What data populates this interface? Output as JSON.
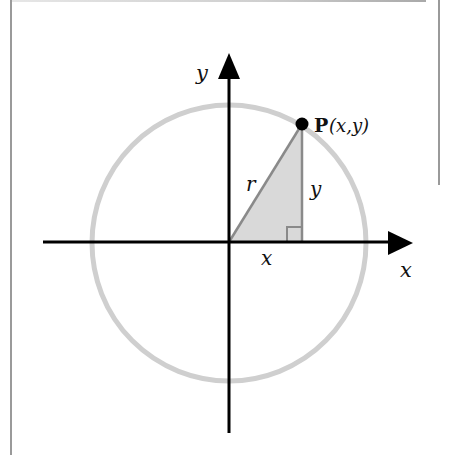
{
  "diagram": {
    "title": "",
    "axes": {
      "x_label": "x",
      "y_label": "y"
    },
    "point": {
      "name": "P",
      "coords_label": "(x,y)"
    },
    "triangle": {
      "hypotenuse_label": "r",
      "vertical_leg_label": "y",
      "horizontal_leg_label": "x",
      "right_angle_marker": true
    },
    "circle": {
      "description": "circle of radius r centered at origin"
    },
    "colors": {
      "axes": "#000000",
      "circle": "#cfcfcf",
      "triangle_fill": "#d9d9d9",
      "triangle_edge": "#8a8a8a",
      "point": "#000000",
      "frame": "#9a9a9a"
    }
  }
}
